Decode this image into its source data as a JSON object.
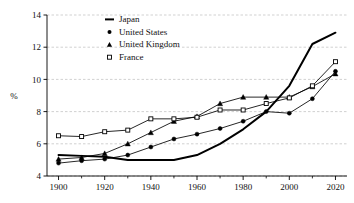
{
  "chart_data": {
    "type": "line",
    "title": "",
    "subtitle": "",
    "xlabel": "",
    "ylabel": "%",
    "xlim": [
      1895,
      2025
    ],
    "ylim": [
      4,
      14
    ],
    "grid": "horizontal-dashed",
    "legend_position": "top-left-inside",
    "x_ticks_major": [
      1900,
      1920,
      1940,
      1960,
      1980,
      2000,
      2020
    ],
    "x_ticks_minor": [
      1910,
      1930,
      1950,
      1970,
      1990,
      2010
    ],
    "x_tick_labels": [
      "1900",
      "1920",
      "1940",
      "1960",
      "1980",
      "2000",
      "2020"
    ],
    "y_ticks": [
      4,
      6,
      8,
      10,
      12,
      14
    ],
    "y_tick_labels": [
      "4",
      "6",
      "8",
      "10",
      "12",
      "14"
    ],
    "x": [
      1900,
      1910,
      1920,
      1930,
      1940,
      1950,
      1960,
      1970,
      1980,
      1990,
      2000,
      2010,
      2020
    ],
    "series": [
      {
        "name": "Japan",
        "marker": "none",
        "line": "solid-thick",
        "color": "#000000",
        "values": [
          5.3,
          5.25,
          5.2,
          5.0,
          5.0,
          5.0,
          5.3,
          6.0,
          6.9,
          8.0,
          9.6,
          12.2,
          12.9
        ]
      },
      {
        "name": "United States",
        "marker": "filled-circle",
        "line": "solid-thin",
        "color": "#000000",
        "values": [
          4.8,
          4.95,
          5.05,
          5.3,
          5.8,
          6.3,
          6.6,
          6.95,
          7.4,
          8.0,
          7.9,
          8.8,
          10.5
        ]
      },
      {
        "name": "United Kingdom",
        "marker": "filled-triangle",
        "line": "solid-thin",
        "color": "#000000",
        "values": [
          5.05,
          5.15,
          5.4,
          6.0,
          6.7,
          7.4,
          7.7,
          8.5,
          8.9,
          8.9,
          8.9,
          9.55,
          10.35
        ]
      },
      {
        "name": "France",
        "marker": "open-square",
        "line": "solid-thin",
        "color": "#000000",
        "values": [
          6.5,
          6.45,
          6.75,
          6.85,
          7.55,
          7.55,
          7.65,
          8.1,
          8.1,
          8.5,
          8.85,
          9.6,
          11.1
        ]
      }
    ]
  },
  "legend": {
    "items": [
      {
        "label": "Japan",
        "marker": "line"
      },
      {
        "label": "United States",
        "marker": "circle"
      },
      {
        "label": "United Kingdom",
        "marker": "triangle"
      },
      {
        "label": "France",
        "marker": "square"
      }
    ]
  },
  "colors": {
    "ink": "#000000",
    "grid": "#bdbdbd",
    "background": "#ffffff"
  }
}
